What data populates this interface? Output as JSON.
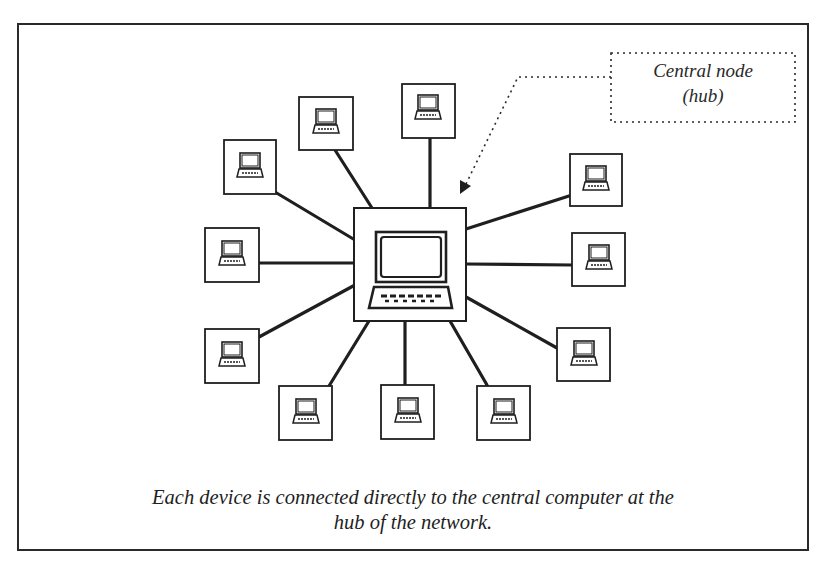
{
  "figure": {
    "callout": {
      "line1": "Central node",
      "line2": "(hub)"
    },
    "caption": {
      "line1": "Each device is connected directly to the central computer at the",
      "line2": "hub of the network."
    }
  },
  "diagram": {
    "type": "star-topology",
    "hub": {
      "label": "central computer",
      "box": [
        353,
        207,
        113,
        114
      ]
    },
    "nodes": [
      {
        "id": "node-upper-left",
        "box": [
          223,
          139,
          53,
          56
        ]
      },
      {
        "id": "node-top-left",
        "box": [
          298,
          96,
          55,
          54
        ]
      },
      {
        "id": "node-top",
        "box": [
          401,
          83,
          54,
          55
        ]
      },
      {
        "id": "node-upper-right",
        "box": [
          569,
          153,
          53,
          53
        ]
      },
      {
        "id": "node-right",
        "box": [
          572,
          232,
          53,
          54
        ]
      },
      {
        "id": "node-lower-right",
        "box": [
          557,
          328,
          53,
          53
        ]
      },
      {
        "id": "node-bottom-right",
        "box": [
          476,
          385,
          54,
          55
        ]
      },
      {
        "id": "node-bottom",
        "box": [
          381,
          385,
          53,
          54
        ]
      },
      {
        "id": "node-bottom-left",
        "box": [
          279,
          386,
          53,
          54
        ]
      },
      {
        "id": "node-lower-left",
        "box": [
          205,
          329,
          54,
          54
        ]
      },
      {
        "id": "node-left",
        "box": [
          205,
          228,
          54,
          54
        ]
      }
    ],
    "colors": {
      "line": "#1f1f1f",
      "background": "#ffffff"
    }
  }
}
